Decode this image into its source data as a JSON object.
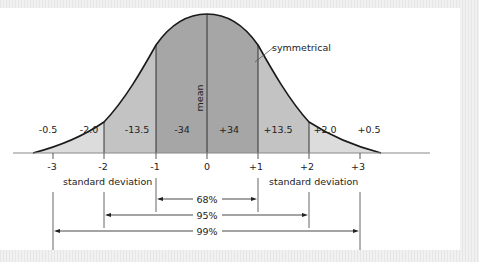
{
  "diagram": {
    "annotations": {
      "mean_label": "mean",
      "symmetry_label": "symmetrical",
      "sd_label_left": "standard deviation",
      "sd_label_right": "standard deviation"
    },
    "axis_ticks": [
      "-3",
      "-2",
      "-1",
      "0",
      "+1",
      "+2",
      "+3"
    ],
    "band_labels": [
      "-0.5",
      "-2.0",
      "-13.5",
      "-34",
      "+34",
      "+13.5",
      "+2.0",
      "+0.5"
    ],
    "ranges": [
      {
        "label": "68%",
        "from": "-1",
        "to": "+1"
      },
      {
        "label": "95%",
        "from": "-2",
        "to": "+2"
      },
      {
        "label": "99%",
        "from": "-3",
        "to": "+3"
      }
    ],
    "colors": {
      "inner_band": "#a6a6a6",
      "middle_band": "#c3c3c3",
      "outer_band": "#dcdcdc",
      "curve": "#1a1a1a",
      "background": "#ffffff"
    }
  }
}
